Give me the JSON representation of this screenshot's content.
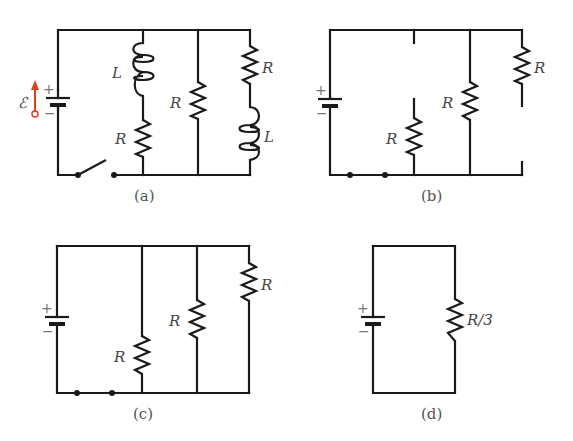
{
  "figure": {
    "panels": [
      {
        "id": "a",
        "caption": "(a)",
        "battery": {
          "plus": "+",
          "minus": "−",
          "emf_label": "ℰ",
          "emf_arrow_color": "#e0401a"
        },
        "switch": "open",
        "branches": [
          {
            "components": [
              {
                "type": "inductor",
                "label": "L"
              },
              {
                "type": "resistor",
                "label": "R"
              }
            ]
          },
          {
            "components": [
              {
                "type": "resistor",
                "label": "R"
              }
            ]
          },
          {
            "components": [
              {
                "type": "resistor",
                "label": "R"
              },
              {
                "type": "inductor",
                "label": "L"
              }
            ]
          }
        ]
      },
      {
        "id": "b",
        "caption": "(b)",
        "battery": {
          "plus": "+",
          "minus": "−"
        },
        "branches": [
          {
            "components": [
              {
                "type": "resistor",
                "label": "R"
              }
            ],
            "state": "open"
          },
          {
            "components": [
              {
                "type": "resistor",
                "label": "R"
              }
            ]
          },
          {
            "components": [
              {
                "type": "resistor",
                "label": "R"
              }
            ],
            "state": "open"
          }
        ]
      },
      {
        "id": "c",
        "caption": "(c)",
        "battery": {
          "plus": "+",
          "minus": "−"
        },
        "branches": [
          {
            "components": [
              {
                "type": "resistor",
                "label": "R"
              }
            ]
          },
          {
            "components": [
              {
                "type": "resistor",
                "label": "R"
              }
            ]
          },
          {
            "components": [
              {
                "type": "resistor",
                "label": "R"
              }
            ]
          }
        ]
      },
      {
        "id": "d",
        "caption": "(d)",
        "battery": {
          "plus": "+",
          "minus": "−"
        },
        "branches": [
          {
            "components": [
              {
                "type": "resistor",
                "label": "R/3"
              }
            ]
          }
        ]
      }
    ]
  },
  "labels": {
    "a": {
      "L1": "L",
      "R1": "R",
      "R2": "R",
      "R3": "R",
      "L2": "L",
      "emf": "ℰ",
      "plus": "+",
      "minus": "−",
      "caption": "(a)"
    },
    "b": {
      "R1": "R",
      "R2": "R",
      "R3": "R",
      "plus": "+",
      "minus": "−",
      "caption": "(b)"
    },
    "c": {
      "R1": "R",
      "R2": "R",
      "R3": "R",
      "plus": "+",
      "minus": "−",
      "caption": "(c)"
    },
    "d": {
      "R1": "R/3",
      "plus": "+",
      "minus": "−",
      "caption": "(d)"
    }
  }
}
